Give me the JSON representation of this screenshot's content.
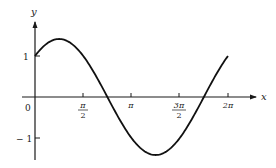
{
  "chart_data": {
    "type": "line",
    "title": "",
    "function": "sin x + cos x",
    "xlabel": "x",
    "ylabel": "y",
    "xlim": [
      0,
      6.2832
    ],
    "ylim": [
      -1.5,
      1.9
    ],
    "grid": false,
    "legend": null,
    "x_ticks": [
      {
        "value": 0,
        "label": "0"
      },
      {
        "value": 1.5708,
        "label_num": "π",
        "label_den": "2"
      },
      {
        "value": 3.1416,
        "label": "π"
      },
      {
        "value": 4.7124,
        "label_num": "3π",
        "label_den": "2"
      },
      {
        "value": 6.2832,
        "label": "2π"
      }
    ],
    "y_ticks": [
      {
        "value": 1,
        "label": "1"
      },
      {
        "value": -1,
        "label": "− 1"
      }
    ],
    "series": [
      {
        "name": "y = sin x + cos x",
        "x": [
          0,
          0.7854,
          1.5708,
          2.3562,
          3.1416,
          3.927,
          4.7124,
          5.4978,
          6.2832
        ],
        "values": [
          1,
          1.414,
          1,
          0,
          -1,
          -1.414,
          -1,
          0,
          1
        ]
      }
    ]
  },
  "labels": {
    "x_axis": "x",
    "y_axis": "y",
    "origin": "0",
    "y_one": "1",
    "y_neg_one": "− 1",
    "pi_half_num": "π",
    "pi_half_den": "2",
    "pi": "π",
    "three_pi_half_num": "3π",
    "three_pi_half_den": "2",
    "two_pi": "2π"
  }
}
